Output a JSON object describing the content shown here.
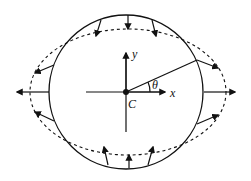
{
  "diagram": {
    "labels": {
      "x_axis": "x",
      "y_axis": "y",
      "center": "C",
      "angle": "θ"
    },
    "shapes": {
      "original_circle": {
        "cx": 126,
        "cy": 92,
        "r": 77,
        "style": "solid"
      },
      "deformed_ellipse": {
        "cx": 128,
        "cy": 92,
        "rx": 98,
        "ry": 63,
        "style": "dashed"
      }
    },
    "arrows": {
      "top": [
        "top-left inward",
        "top-center inward",
        "top-right inward"
      ],
      "bottom": [
        "bottom-left inward",
        "bottom-center inward",
        "bottom-right inward"
      ],
      "left": [
        "upper-left outward",
        "left-center outward",
        "lower-left outward"
      ],
      "right": [
        "upper-right outward",
        "right-center outward",
        "lower-right outward"
      ]
    },
    "colors": {
      "stroke": "#111111",
      "background": "#ffffff"
    }
  }
}
